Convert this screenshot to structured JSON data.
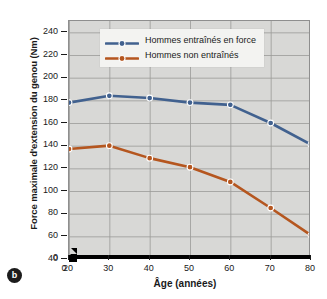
{
  "figure": {
    "panel_label": "b",
    "colors": {
      "series_trained": "#41618f",
      "series_untrained": "#b5561f",
      "plot_background": "#d8d8d6",
      "grid": "#9a9a98",
      "axis": "#000000"
    }
  },
  "chart_data": {
    "type": "line",
    "title": "",
    "xlabel": "Âge (années)",
    "ylabel": "Force maximale d'extension du genou (Nm)",
    "x": [
      20,
      30,
      40,
      50,
      60,
      70,
      80
    ],
    "xtick_labels": [
      "0",
      "20",
      "30",
      "40",
      "50",
      "60",
      "70",
      "80"
    ],
    "ytick_labels": [
      "0",
      "40",
      "60",
      "80",
      "100",
      "120",
      "140",
      "160",
      "180",
      "200",
      "220",
      "240"
    ],
    "xlim": [
      20,
      80
    ],
    "ylim": [
      40,
      250
    ],
    "grid": true,
    "axis_break_x": true,
    "legend_position": "top-center",
    "series": [
      {
        "name": "Hommes entraînés en force",
        "color": "#41618f",
        "values": [
          178,
          184,
          182,
          178,
          176,
          160,
          141
        ]
      },
      {
        "name": "Hommes non entraînés",
        "color": "#b5561f",
        "values": [
          137,
          140,
          129,
          121,
          108,
          85,
          61
        ]
      }
    ]
  }
}
